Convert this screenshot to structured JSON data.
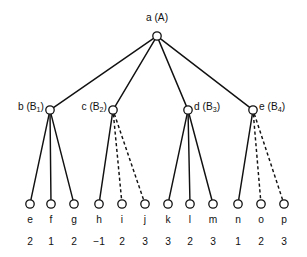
{
  "figure": {
    "kind": "game-tree-diagram",
    "background_color": "#ffffff",
    "ink_color": "#111111",
    "width": 307,
    "height": 257
  },
  "root": {
    "id": "a",
    "label_name": "a",
    "label_group": "(A)",
    "label_full": "a (A)",
    "x": 157,
    "y": 36,
    "label_x": 157,
    "label_y": 21,
    "label_anchor": "middle"
  },
  "internal_nodes": [
    {
      "id": "b",
      "label_name": "b",
      "label_base": "(B",
      "label_sub": "1",
      "label_close": ")",
      "label_full": "b (B1)",
      "x": 50,
      "y": 110,
      "label_x": 44,
      "label_y": 110,
      "label_anchor": "end"
    },
    {
      "id": "c",
      "label_name": "c",
      "label_base": "(B",
      "label_sub": "2",
      "label_close": ")",
      "label_full": "c (B2)",
      "x": 113,
      "y": 110,
      "label_x": 107,
      "label_y": 110,
      "label_anchor": "end"
    },
    {
      "id": "d",
      "label_name": "d",
      "label_base": "(B",
      "label_sub": "3",
      "label_close": ")",
      "label_full": "d (B3)",
      "x": 188,
      "y": 110,
      "label_x": 194,
      "label_y": 110,
      "label_anchor": "start"
    },
    {
      "id": "e",
      "label_name": "e",
      "label_base": "(B",
      "label_sub": "4",
      "label_close": ")",
      "label_full": "e (B4)",
      "x": 253,
      "y": 110,
      "label_x": 259,
      "label_y": 110,
      "label_anchor": "start"
    }
  ],
  "leaves": [
    {
      "id": "e",
      "name": "e",
      "value": "2",
      "x": 30,
      "y": 204,
      "parent": "b",
      "edge_style": "solid"
    },
    {
      "id": "f",
      "name": "f",
      "value": "1",
      "x": 51,
      "y": 204,
      "parent": "b",
      "edge_style": "solid"
    },
    {
      "id": "g",
      "name": "g",
      "value": "2",
      "x": 74,
      "y": 204,
      "parent": "b",
      "edge_style": "solid"
    },
    {
      "id": "h",
      "name": "h",
      "value": "-1",
      "x": 99,
      "y": 204,
      "parent": "c",
      "edge_style": "solid"
    },
    {
      "id": "i",
      "name": "i",
      "value": "2",
      "x": 122,
      "y": 204,
      "parent": "c",
      "edge_style": "dashed"
    },
    {
      "id": "j",
      "name": "j",
      "value": "3",
      "x": 145,
      "y": 204,
      "parent": "c",
      "edge_style": "dashed"
    },
    {
      "id": "k",
      "name": "k",
      "value": "3",
      "x": 168,
      "y": 204,
      "parent": "d",
      "edge_style": "solid"
    },
    {
      "id": "l",
      "name": "l",
      "value": "2",
      "x": 190,
      "y": 204,
      "parent": "d",
      "edge_style": "solid"
    },
    {
      "id": "m",
      "name": "m",
      "value": "3",
      "x": 213,
      "y": 204,
      "parent": "d",
      "edge_style": "solid"
    },
    {
      "id": "n",
      "name": "n",
      "value": "1",
      "x": 238,
      "y": 204,
      "parent": "e",
      "edge_style": "solid"
    },
    {
      "id": "o",
      "name": "o",
      "value": "2",
      "x": 261,
      "y": 204,
      "parent": "e",
      "edge_style": "dashed"
    },
    {
      "id": "p",
      "name": "p",
      "value": "3",
      "x": 284,
      "y": 204,
      "parent": "e",
      "edge_style": "dashed"
    }
  ],
  "rows": {
    "leaf_name_y": 223,
    "leaf_value_y": 245
  },
  "geometry": {
    "root_radius": 4.2,
    "internal_radius": 4.2,
    "leaf_radius": 4.2
  },
  "edges_root_to_internal": [
    {
      "from": "a",
      "to": "b",
      "style": "solid"
    },
    {
      "from": "a",
      "to": "c",
      "style": "solid"
    },
    {
      "from": "a",
      "to": "d",
      "style": "solid"
    },
    {
      "from": "a",
      "to": "e",
      "style": "solid"
    }
  ]
}
